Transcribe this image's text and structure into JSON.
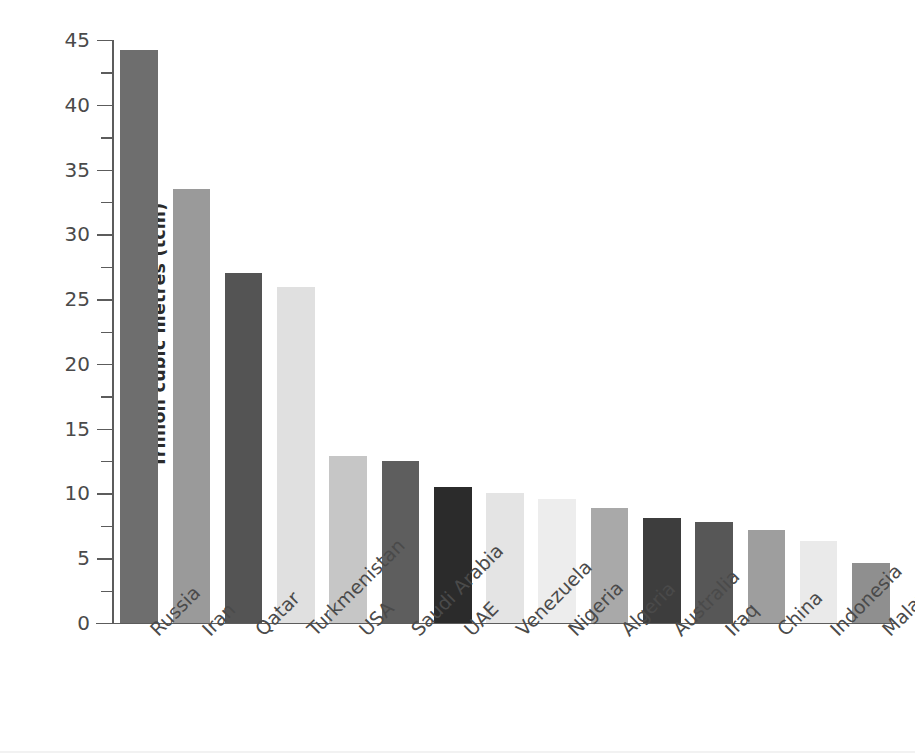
{
  "chart_data": {
    "type": "bar",
    "title": "",
    "subtitle": "",
    "xlabel": "",
    "ylabel": "Trillion cubic metres (tcm)",
    "ylim": [
      0,
      45
    ],
    "ytick_step": 5,
    "yminor_step": 2.5,
    "grid": false,
    "legend": null,
    "categories": [
      "Russia",
      "Iran",
      "Qatar",
      "Turkmenistan",
      "USA",
      "Saudi Arabia",
      "UAE",
      "Venezuela",
      "Nigeria",
      "Algeria",
      "Australia",
      "Iraq",
      "China",
      "Indonesia",
      "Malaysia"
    ],
    "values": [
      44.2,
      33.5,
      27.0,
      25.9,
      12.9,
      12.5,
      10.5,
      10.0,
      9.6,
      8.9,
      8.1,
      7.8,
      7.2,
      6.3,
      4.6
    ],
    "ytick_labels": [
      "0",
      "5",
      "10",
      "15",
      "20",
      "25",
      "30",
      "35",
      "40",
      "45"
    ],
    "ytick_values": [
      0,
      5,
      10,
      15,
      20,
      25,
      30,
      35,
      40,
      45
    ],
    "bar_colors": [
      "#6e6e6e",
      "#9a9a9a",
      "#545454",
      "#e0e0e0",
      "#c6c6c6",
      "#5e5e5e",
      "#2b2b2b",
      "#e4e4e4",
      "#ededed",
      "#a9a9a9",
      "#3d3d3d",
      "#575757",
      "#9e9e9e",
      "#eaeaea",
      "#8f8f8f"
    ],
    "axis_color": "#5c5c5c",
    "text_color": "#4a4a4a",
    "background": "#ffffff"
  }
}
